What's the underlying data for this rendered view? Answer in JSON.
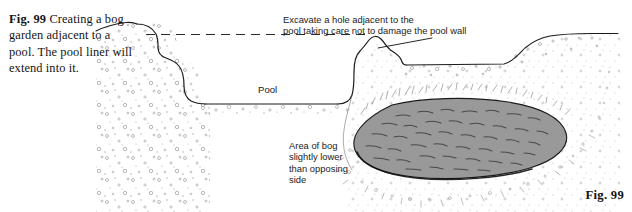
{
  "figure": {
    "caption_label": "Fig. 99",
    "caption_text": " Creating a bog garden adjacent to a pool. The pool liner will extend into it.",
    "corner_label": "Fig. 99"
  },
  "annotations": {
    "excavate": "Excavate a hole adjacent to the\npool taking care not to damage the pool wall",
    "pool": "Pool",
    "bog": "Area of bog\nslightly lower\nthan opposing\nside"
  },
  "diagram": {
    "type": "cross-section-illustration",
    "elements": [
      "ground-profile-line",
      "pool-excavation-stepped-shelf",
      "water-level-dashed-line",
      "pool-wall-mound",
      "bog-area-gray-pond",
      "soil-stipple-texture",
      "grass-hatching-texture",
      "leader-line-to-pool-wall"
    ]
  },
  "colors": {
    "background": "#ffffff",
    "ink": "#1b1b1b",
    "bog_fill": "#999999",
    "bog_marks": "#4d4d4d",
    "stipple": "#8d8d8d",
    "text": "#141414"
  }
}
